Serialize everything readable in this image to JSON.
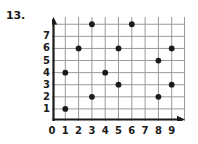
{
  "problem": {
    "number": "13."
  },
  "chart_data": {
    "type": "scatter",
    "title": "",
    "subtitle": "",
    "xlabel": "",
    "ylabel": "",
    "xlim": [
      0,
      10
    ],
    "ylim": [
      0,
      8.6
    ],
    "grid": true,
    "legend": null,
    "annotations": [],
    "x_tick_labels": [
      "0",
      "1",
      "2",
      "3",
      "4",
      "5",
      "6",
      "7",
      "8",
      "9"
    ],
    "y_tick_labels": [
      "1",
      "2",
      "3",
      "4",
      "5",
      "6",
      "7"
    ],
    "x_ticks": [
      0,
      1,
      2,
      3,
      4,
      5,
      6,
      7,
      8,
      9
    ],
    "y_ticks": [
      1,
      2,
      3,
      4,
      5,
      6,
      7
    ],
    "point_color": "#1b1b1b",
    "grid_color": "#9a9a9a",
    "axis_color": "#1b1b1b",
    "points": [
      {
        "x": 1,
        "y": 1
      },
      {
        "x": 1,
        "y": 4
      },
      {
        "x": 2,
        "y": 6
      },
      {
        "x": 3,
        "y": 2
      },
      {
        "x": 3,
        "y": 8
      },
      {
        "x": 4,
        "y": 4
      },
      {
        "x": 5,
        "y": 3
      },
      {
        "x": 5,
        "y": 6
      },
      {
        "x": 6,
        "y": 8
      },
      {
        "x": 8,
        "y": 2
      },
      {
        "x": 8,
        "y": 5
      },
      {
        "x": 9,
        "y": 3
      },
      {
        "x": 9,
        "y": 6
      }
    ]
  }
}
